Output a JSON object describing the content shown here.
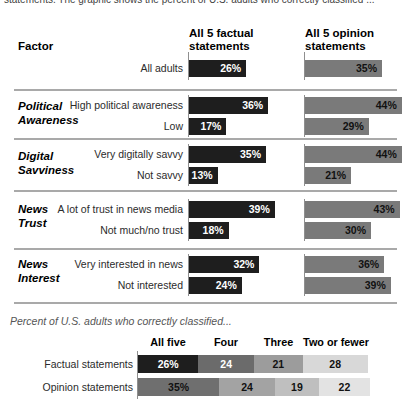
{
  "intro_cut_text": "statements. The graphic shows the percent of U.S. adults who correctly classified ...",
  "colors": {
    "factual_bar": "#1e1e1e",
    "opinion_bar": "#7a7a7a",
    "divider": "#a9a9a9",
    "factual_segments": [
      "#1e1e1e",
      "#6b6b6b",
      "#9c9c9c",
      "#d8d8d8"
    ],
    "opinion_segments": [
      "#6f6f6f",
      "#a3a3a3",
      "#bfbfbf",
      "#e3e3e3"
    ]
  },
  "chart_data": [
    {
      "type": "bar",
      "orientation": "horizontal",
      "factor_header": "Factor",
      "series_headers": [
        "All 5 factual statements",
        "All 5 opinion statements"
      ],
      "xlim": [
        0,
        50
      ],
      "all_adults": {
        "label": "All adults",
        "factual": 26,
        "opinion": 35,
        "factual_display": "26%",
        "opinion_display": "35%"
      },
      "sections": [
        {
          "factor": "Political Awareness",
          "factor_line1": "Political",
          "factor_line2": "Awareness",
          "rows": [
            {
              "label": "High political awareness",
              "factual": 36,
              "opinion": 44,
              "factual_display": "36%",
              "opinion_display": "44%"
            },
            {
              "label": "Low",
              "factual": 17,
              "opinion": 29,
              "factual_display": "17%",
              "opinion_display": "29%"
            }
          ]
        },
        {
          "factor": "Digital Savviness",
          "factor_line1": "Digital",
          "factor_line2": "Savviness",
          "rows": [
            {
              "label": "Very digitally savvy",
              "factual": 35,
              "opinion": 44,
              "factual_display": "35%",
              "opinion_display": "44%"
            },
            {
              "label": "Not savvy",
              "factual": 13,
              "opinion": 21,
              "factual_display": "13%",
              "opinion_display": "21%"
            }
          ]
        },
        {
          "factor": "News Trust",
          "factor_line1": "News",
          "factor_line2": "Trust",
          "rows": [
            {
              "label": "A lot of trust in news media",
              "factual": 39,
              "opinion": 43,
              "factual_display": "39%",
              "opinion_display": "43%"
            },
            {
              "label": "Not much/no trust",
              "factual": 18,
              "opinion": 30,
              "factual_display": "18%",
              "opinion_display": "30%"
            }
          ]
        },
        {
          "factor": "News Interest",
          "factor_line1": "News",
          "factor_line2": "Interest",
          "rows": [
            {
              "label": "Very interested in news",
              "factual": 32,
              "opinion": 36,
              "factual_display": "32%",
              "opinion_display": "36%"
            },
            {
              "label": "Not interested",
              "factual": 24,
              "opinion": 39,
              "factual_display": "24%",
              "opinion_display": "39%"
            }
          ]
        }
      ]
    },
    {
      "type": "stacked-bar",
      "title": "Percent of U.S. adults who correctly classified...",
      "categories": [
        "All five",
        "Four",
        "Three",
        "Two or fewer"
      ],
      "series": [
        {
          "name": "Factual statements",
          "values": [
            26,
            24,
            21,
            28
          ],
          "displays": [
            "26%",
            "24",
            "21",
            "28"
          ]
        },
        {
          "name": "Opinion statements",
          "values": [
            35,
            24,
            19,
            22
          ],
          "displays": [
            "35%",
            "24",
            "19",
            "22"
          ]
        }
      ]
    }
  ]
}
